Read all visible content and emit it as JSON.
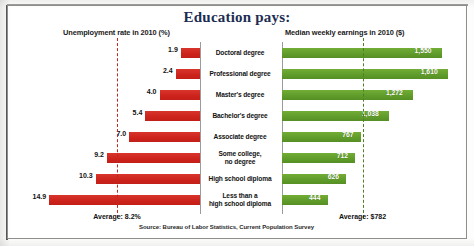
{
  "figure": {
    "title": "Education pays:",
    "source": "Source: Bureau of Labor Statistics, Current Population Survey",
    "left_header": "Unemployment rate in 2010 (%)",
    "right_header": "Median weekly earnings in 2010 ($)",
    "left_average_label": "Average: 8.2%",
    "right_average_label": "Average: $782",
    "colors": {
      "title": "#1b2d52",
      "unemployment_bar": "#cc231c",
      "earnings_bar": "#66a22e",
      "left_average_line": "#c0281f",
      "right_average_line": "#4f7f23",
      "frame": "#8e8e8e",
      "background": "#ffffff"
    }
  },
  "chart_data": {
    "type": "bar",
    "title": "Education pays:",
    "subtitle": "",
    "orientation": "horizontal-diverging",
    "categories": [
      "Doctoral degree",
      "Professional degree",
      "Master's degree",
      "Bachelor's degree",
      "Associate degree",
      "Some college,\nno degree",
      "High school diploma",
      "Less than a\nhigh school diploma"
    ],
    "series": [
      {
        "name": "Unemployment rate in 2010 (%)",
        "direction": "left",
        "color": "#cc231c",
        "unit": "%",
        "values": [
          1.9,
          2.4,
          4.0,
          5.4,
          7.0,
          9.2,
          10.3,
          14.9
        ],
        "labels": [
          "1.9",
          "2.4",
          "4.0",
          "5.4",
          "7.0",
          "9.2",
          "10.3",
          "14.9"
        ],
        "average": 8.2,
        "average_label": "Average: 8.2%",
        "axis_max": 16.0
      },
      {
        "name": "Median weekly earnings in 2010 ($)",
        "direction": "right",
        "color": "#66a22e",
        "unit": "$",
        "values": [
          1550,
          1610,
          1272,
          1038,
          767,
          712,
          626,
          444
        ],
        "labels": [
          "1,550",
          "1,610",
          "1,272",
          "1,038",
          "767",
          "712",
          "626",
          "444"
        ],
        "average": 782,
        "average_label": "Average: $782",
        "axis_max": 1720
      }
    ],
    "xlabel": "",
    "ylabel": "",
    "grid": false,
    "legend": "none",
    "annotations": [
      "Average: 8.2%",
      "Average: $782"
    ],
    "source": "Source: Bureau of Labor Statistics, Current Population Survey"
  }
}
